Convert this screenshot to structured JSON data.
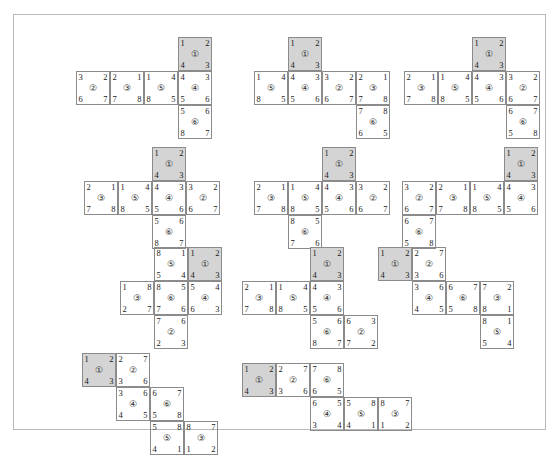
{
  "figure": {
    "background_color": "#ffffff",
    "frame_color": "#b9b9b9",
    "cell_border_color": "#8b8b8b",
    "shaded_cell_color": "#d4d4d4",
    "cell_size": 34,
    "pattern_count": 11
  },
  "patterns": [
    {
      "id": "pattern-1",
      "x": 62,
      "y": 22,
      "cells": [
        {
          "face": "①",
          "col": 3,
          "row": 0,
          "shaded": true,
          "tl": "1",
          "tr": "2",
          "bl": "4",
          "br": "3"
        },
        {
          "face": "②",
          "col": 0,
          "row": 1,
          "shaded": false,
          "tl": "3",
          "tr": "2",
          "bl": "6",
          "br": "7"
        },
        {
          "face": "③",
          "col": 1,
          "row": 1,
          "shaded": false,
          "tl": "2",
          "tr": "1",
          "bl": "7",
          "br": "8"
        },
        {
          "face": "⑤",
          "col": 2,
          "row": 1,
          "shaded": false,
          "tl": "1",
          "tr": "4",
          "bl": "8",
          "br": "5"
        },
        {
          "face": "④",
          "col": 3,
          "row": 1,
          "shaded": false,
          "tl": "4",
          "tr": "3",
          "bl": "5",
          "br": "6"
        },
        {
          "face": "⑥",
          "col": 3,
          "row": 2,
          "shaded": false,
          "tl": "5",
          "tr": "6",
          "bl": "8",
          "br": "7"
        }
      ]
    },
    {
      "id": "pattern-2",
      "x": 240,
      "y": 22,
      "cells": [
        {
          "face": "①",
          "col": 1,
          "row": 0,
          "shaded": true,
          "tl": "1",
          "tr": "2",
          "bl": "4",
          "br": "3"
        },
        {
          "face": "⑤",
          "col": 0,
          "row": 1,
          "shaded": false,
          "tl": "1",
          "tr": "4",
          "bl": "8",
          "br": "5"
        },
        {
          "face": "④",
          "col": 1,
          "row": 1,
          "shaded": false,
          "tl": "4",
          "tr": "3",
          "bl": "5",
          "br": "6"
        },
        {
          "face": "②",
          "col": 2,
          "row": 1,
          "shaded": false,
          "tl": "3",
          "tr": "2",
          "bl": "6",
          "br": "7"
        },
        {
          "face": "③",
          "col": 3,
          "row": 1,
          "shaded": false,
          "tl": "2",
          "tr": "1",
          "bl": "7",
          "br": "8"
        },
        {
          "face": "⑥",
          "col": 3,
          "row": 2,
          "shaded": false,
          "tl": "7",
          "tr": "8",
          "bl": "6",
          "br": "5"
        }
      ]
    },
    {
      "id": "pattern-3",
      "x": 390,
      "y": 22,
      "cells": [
        {
          "face": "①",
          "col": 2,
          "row": 0,
          "shaded": true,
          "tl": "1",
          "tr": "2",
          "bl": "4",
          "br": "3"
        },
        {
          "face": "③",
          "col": 0,
          "row": 1,
          "shaded": false,
          "tl": "2",
          "tr": "1",
          "bl": "7",
          "br": "8"
        },
        {
          "face": "⑤",
          "col": 1,
          "row": 1,
          "shaded": false,
          "tl": "1",
          "tr": "4",
          "bl": "8",
          "br": "5"
        },
        {
          "face": "④",
          "col": 2,
          "row": 1,
          "shaded": false,
          "tl": "4",
          "tr": "3",
          "bl": "5",
          "br": "6"
        },
        {
          "face": "②",
          "col": 3,
          "row": 1,
          "shaded": false,
          "tl": "3",
          "tr": "2",
          "bl": "6",
          "br": "7"
        },
        {
          "face": "⑥",
          "col": 3,
          "row": 2,
          "shaded": false,
          "tl": "6",
          "tr": "7",
          "bl": "5",
          "br": "8"
        }
      ]
    },
    {
      "id": "pattern-4",
      "x": 70,
      "y": 132,
      "cells": [
        {
          "face": "①",
          "col": 2,
          "row": 0,
          "shaded": true,
          "tl": "1",
          "tr": "2",
          "bl": "4",
          "br": "3"
        },
        {
          "face": "③",
          "col": 0,
          "row": 1,
          "shaded": false,
          "tl": "2",
          "tr": "1",
          "bl": "7",
          "br": "8"
        },
        {
          "face": "⑤",
          "col": 1,
          "row": 1,
          "shaded": false,
          "tl": "1",
          "tr": "4",
          "bl": "8",
          "br": "5"
        },
        {
          "face": "④",
          "col": 2,
          "row": 1,
          "shaded": false,
          "tl": "4",
          "tr": "3",
          "bl": "5",
          "br": "6"
        },
        {
          "face": "②",
          "col": 3,
          "row": 1,
          "shaded": false,
          "tl": "3",
          "tr": "2",
          "bl": "6",
          "br": "7"
        },
        {
          "face": "⑥",
          "col": 2,
          "row": 2,
          "shaded": false,
          "tl": "5",
          "tr": "6",
          "bl": "8",
          "br": "7"
        }
      ]
    },
    {
      "id": "pattern-5",
      "x": 240,
      "y": 132,
      "cells": [
        {
          "face": "①",
          "col": 2,
          "row": 0,
          "shaded": true,
          "tl": "1",
          "tr": "2",
          "bl": "4",
          "br": "3"
        },
        {
          "face": "③",
          "col": 0,
          "row": 1,
          "shaded": false,
          "tl": "2",
          "tr": "1",
          "bl": "7",
          "br": "8"
        },
        {
          "face": "⑤",
          "col": 1,
          "row": 1,
          "shaded": false,
          "tl": "1",
          "tr": "4",
          "bl": "8",
          "br": "5"
        },
        {
          "face": "④",
          "col": 2,
          "row": 1,
          "shaded": false,
          "tl": "4",
          "tr": "3",
          "bl": "5",
          "br": "6"
        },
        {
          "face": "②",
          "col": 3,
          "row": 1,
          "shaded": false,
          "tl": "3",
          "tr": "2",
          "bl": "6",
          "br": "7"
        },
        {
          "face": "⑥",
          "col": 1,
          "row": 2,
          "shaded": false,
          "tl": "8",
          "tr": "5",
          "bl": "7",
          "br": "6"
        }
      ]
    },
    {
      "id": "pattern-6",
      "x": 388,
      "y": 132,
      "cells": [
        {
          "face": "①",
          "col": 3,
          "row": 0,
          "shaded": true,
          "tl": "1",
          "tr": "2",
          "bl": "4",
          "br": "3"
        },
        {
          "face": "②",
          "col": 0,
          "row": 1,
          "shaded": false,
          "tl": "3",
          "tr": "2",
          "bl": "6",
          "br": "7"
        },
        {
          "face": "③",
          "col": 1,
          "row": 1,
          "shaded": false,
          "tl": "2",
          "tr": "1",
          "bl": "7",
          "br": "8"
        },
        {
          "face": "⑤",
          "col": 2,
          "row": 1,
          "shaded": false,
          "tl": "1",
          "tr": "4",
          "bl": "8",
          "br": "5"
        },
        {
          "face": "④",
          "col": 3,
          "row": 1,
          "shaded": false,
          "tl": "4",
          "tr": "3",
          "bl": "5",
          "br": "6"
        },
        {
          "face": "⑥",
          "col": 0,
          "row": 2,
          "shaded": false,
          "tl": "6",
          "tr": "7",
          "bl": "5",
          "br": "8"
        }
      ]
    },
    {
      "id": "pattern-7",
      "x": 72,
      "y": 232,
      "cells": [
        {
          "face": "⑤",
          "col": 2,
          "row": 0,
          "shaded": false,
          "tl": "8",
          "tr": "1",
          "bl": "5",
          "br": "4"
        },
        {
          "face": "①",
          "col": 3,
          "row": 0,
          "shaded": true,
          "tl": "1",
          "tr": "2",
          "bl": "4",
          "br": "3"
        },
        {
          "face": "③",
          "col": 1,
          "row": 1,
          "shaded": false,
          "tl": "1",
          "tr": "8",
          "bl": "2",
          "br": "7"
        },
        {
          "face": "⑥",
          "col": 2,
          "row": 1,
          "shaded": false,
          "tl": "8",
          "tr": "5",
          "bl": "7",
          "br": "6"
        },
        {
          "face": "④",
          "col": 3,
          "row": 1,
          "shaded": false,
          "tl": "5",
          "tr": "4",
          "bl": "6",
          "br": "3"
        },
        {
          "face": "②",
          "col": 2,
          "row": 2,
          "shaded": false,
          "tl": "7",
          "tr": "6",
          "bl": "2",
          "br": "3"
        }
      ]
    },
    {
      "id": "pattern-8",
      "x": 228,
      "y": 232,
      "cells": [
        {
          "face": "①",
          "col": 2,
          "row": 0,
          "shaded": true,
          "tl": "1",
          "tr": "2",
          "bl": "4",
          "br": "3"
        },
        {
          "face": "③",
          "col": 0,
          "row": 1,
          "shaded": false,
          "tl": "2",
          "tr": "1",
          "bl": "7",
          "br": "8"
        },
        {
          "face": "⑤",
          "col": 1,
          "row": 1,
          "shaded": false,
          "tl": "1",
          "tr": "4",
          "bl": "8",
          "br": "5"
        },
        {
          "face": "④",
          "col": 2,
          "row": 1,
          "shaded": false,
          "tl": "4",
          "tr": "3",
          "bl": "5",
          "br": "6"
        },
        {
          "face": "⑥",
          "col": 2,
          "row": 2,
          "shaded": false,
          "tl": "5",
          "tr": "6",
          "bl": "8",
          "br": "7"
        },
        {
          "face": "②",
          "col": 3,
          "row": 2,
          "shaded": false,
          "tl": "6",
          "tr": "3",
          "bl": "7",
          "br": "2"
        }
      ]
    },
    {
      "id": "pattern-9",
      "x": 364,
      "y": 232,
      "cells": [
        {
          "face": "①",
          "col": 0,
          "row": 0,
          "shaded": true,
          "tl": "1",
          "tr": "2",
          "bl": "4",
          "br": "3"
        },
        {
          "face": "②",
          "col": 1,
          "row": 0,
          "shaded": false,
          "tl": "2",
          "tr": "7",
          "bl": "3",
          "br": "6"
        },
        {
          "face": "④",
          "col": 1,
          "row": 1,
          "shaded": false,
          "tl": "3",
          "tr": "6",
          "bl": "4",
          "br": "5"
        },
        {
          "face": "⑥",
          "col": 2,
          "row": 1,
          "shaded": false,
          "tl": "6",
          "tr": "7",
          "bl": "5",
          "br": "8"
        },
        {
          "face": "③",
          "col": 3,
          "row": 1,
          "shaded": false,
          "tl": "7",
          "tr": "2",
          "bl": "8",
          "br": "1"
        },
        {
          "face": "⑤",
          "col": 3,
          "row": 2,
          "shaded": false,
          "tl": "8",
          "tr": "1",
          "bl": "5",
          "br": "4"
        }
      ]
    },
    {
      "id": "pattern-10",
      "x": 68,
      "y": 338,
      "cells": [
        {
          "face": "①",
          "col": 0,
          "row": 0,
          "shaded": true,
          "tl": "1",
          "tr": "2",
          "bl": "4",
          "br": "3"
        },
        {
          "face": "②",
          "col": 1,
          "row": 0,
          "shaded": false,
          "tl": "2",
          "tr": "7",
          "bl": "3",
          "br": "6"
        },
        {
          "face": "④",
          "col": 1,
          "row": 1,
          "shaded": false,
          "tl": "3",
          "tr": "6",
          "bl": "4",
          "br": "5"
        },
        {
          "face": "⑥",
          "col": 2,
          "row": 1,
          "shaded": false,
          "tl": "6",
          "tr": "7",
          "bl": "5",
          "br": "8"
        },
        {
          "face": "⑤",
          "col": 2,
          "row": 2,
          "shaded": false,
          "tl": "5",
          "tr": "8",
          "bl": "4",
          "br": "1"
        },
        {
          "face": "③",
          "col": 3,
          "row": 2,
          "shaded": false,
          "tl": "8",
          "tr": "7",
          "bl": "1",
          "br": "2"
        }
      ]
    },
    {
      "id": "pattern-11",
      "x": 228,
      "y": 348,
      "cells": [
        {
          "face": "①",
          "col": 0,
          "row": 0,
          "shaded": true,
          "tl": "1",
          "tr": "2",
          "bl": "4",
          "br": "3"
        },
        {
          "face": "②",
          "col": 1,
          "row": 0,
          "shaded": false,
          "tl": "2",
          "tr": "7",
          "bl": "3",
          "br": "6"
        },
        {
          "face": "⑥",
          "col": 2,
          "row": 0,
          "shaded": false,
          "tl": "7",
          "tr": "8",
          "bl": "6",
          "br": "5"
        },
        {
          "face": "④",
          "col": 2,
          "row": 1,
          "shaded": false,
          "tl": "6",
          "tr": "5",
          "bl": "3",
          "br": "4"
        },
        {
          "face": "⑤",
          "col": 3,
          "row": 1,
          "shaded": false,
          "tl": "5",
          "tr": "8",
          "bl": "4",
          "br": "1"
        },
        {
          "face": "③",
          "col": 4,
          "row": 1,
          "shaded": false,
          "tl": "8",
          "tr": "7",
          "bl": "1",
          "br": "2"
        }
      ]
    }
  ]
}
